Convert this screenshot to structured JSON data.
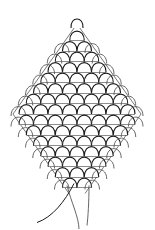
{
  "drawing": {
    "subject": "scale-patterned diamond shape (pinecone / woven net)",
    "stroke_color": "#1a1a1a",
    "secondary_stroke_color": "#555555",
    "background": "#ffffff",
    "rows": [
      1,
      2,
      3,
      4,
      5,
      6,
      7,
      8,
      8,
      7,
      6,
      5,
      4,
      3,
      2
    ],
    "has_top_knob": true,
    "has_hanging_strings": true
  }
}
